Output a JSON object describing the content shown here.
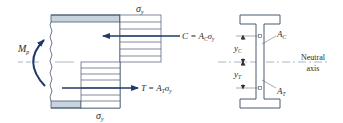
{
  "diagram": {
    "colors": {
      "line": "#2b3a55",
      "arrow": "#1f3a66",
      "flange_fill": "#c7d3df",
      "outline": "#4a5a70",
      "axis": "#8fa3b8",
      "text": "#2a2a2a"
    },
    "labels": {
      "moment": "M",
      "moment_sub": "p",
      "sigma_top": "σ",
      "sigma_top_sub": "y",
      "sigma_bottom": "σ",
      "sigma_bottom_sub": "y",
      "compression_force": "C = A",
      "compression_force_sub": "C",
      "compression_force_tail": "σ",
      "compression_force_tail_sub": "y",
      "tension_force": "T = A",
      "tension_force_sub": "T",
      "tension_force_tail": "σ",
      "tension_force_tail_sub": "y",
      "y_c": "y",
      "y_c_sub": "C",
      "y_t": "y",
      "y_t_sub": "T",
      "area_c": "A",
      "area_c_sub": "C",
      "area_t": "A",
      "area_t_sub": "T",
      "neutral_axis_line1": "Neutral",
      "neutral_axis_line2": "axis"
    },
    "icons": {
      "moment_arrow": "curved-arrow-icon",
      "compression_arrow": "arrow-left-icon",
      "tension_arrow": "arrow-right-icon"
    }
  }
}
